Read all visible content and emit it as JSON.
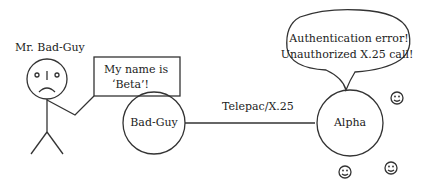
{
  "attacker": {
    "label": "Mr. Bad-Guy",
    "speech_line1": "My name is",
    "speech_line2": "‘Beta’!"
  },
  "nodes": {
    "left": "Bad-Guy",
    "right": "Alpha"
  },
  "link": {
    "label": "Telepac/X.25"
  },
  "alpha_speech": {
    "line1": "Authentication error!",
    "line2": "Unauthorized X.25 call!"
  },
  "bystanders": {
    "icon": "smiley-face-icon",
    "count": 3
  }
}
